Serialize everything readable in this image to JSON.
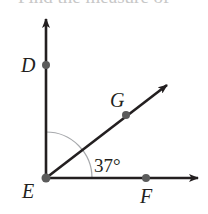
{
  "question": {
    "clipped_text": "Find the measure of"
  },
  "diagram": {
    "vertex": "E",
    "points": {
      "D": {
        "label": "D",
        "x": 46,
        "y": 65
      },
      "E": {
        "label": "E",
        "x": 46,
        "y": 178
      },
      "F": {
        "label": "F",
        "x": 146,
        "y": 178
      },
      "G": {
        "label": "G",
        "x": 126,
        "y": 115
      }
    },
    "rays": [
      {
        "name": "ray-ED",
        "from": "E",
        "toward": "D"
      },
      {
        "name": "ray-EG",
        "from": "E",
        "toward": "G"
      },
      {
        "name": "ray-EF",
        "from": "E",
        "toward": "F"
      }
    ],
    "angle_label": "37°",
    "angle_between": [
      "G",
      "E",
      "F"
    ],
    "colors": {
      "line": "#231f20",
      "point": "#5b5b5b",
      "arc": "#a7a9ac"
    }
  }
}
